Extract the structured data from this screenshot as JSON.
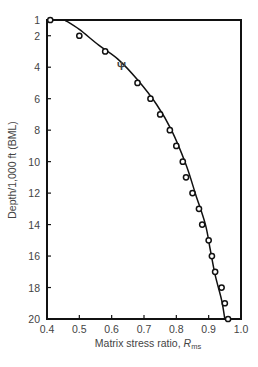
{
  "chart_data": {
    "type": "scatter",
    "title": "",
    "xlabel": "Matrix stress ratio, R",
    "xlabel_subscript": "ms",
    "ylabel": "Depth/1,000 ft (BML)",
    "xlim": [
      0.4,
      1.0
    ],
    "ylim": [
      20,
      1
    ],
    "y_inverted": true,
    "grid": false,
    "legend": null,
    "x_ticks": [
      "0.4",
      "0.5",
      "0.6",
      "0.7",
      "0.8",
      "0.9",
      "1.0"
    ],
    "y_ticks": [
      "1",
      "2",
      "4",
      "6",
      "8",
      "10",
      "12",
      "14",
      "16",
      "18",
      "20"
    ],
    "series": [
      {
        "name": "Measured data",
        "style": "open-circle",
        "points": [
          {
            "x": 0.41,
            "y": 1
          },
          {
            "x": 0.5,
            "y": 2
          },
          {
            "x": 0.58,
            "y": 3
          },
          {
            "x": 0.68,
            "y": 5
          },
          {
            "x": 0.72,
            "y": 6
          },
          {
            "x": 0.75,
            "y": 7
          },
          {
            "x": 0.78,
            "y": 8
          },
          {
            "x": 0.8,
            "y": 9
          },
          {
            "x": 0.82,
            "y": 10
          },
          {
            "x": 0.83,
            "y": 11
          },
          {
            "x": 0.85,
            "y": 12
          },
          {
            "x": 0.87,
            "y": 13
          },
          {
            "x": 0.88,
            "y": 14
          },
          {
            "x": 0.9,
            "y": 15
          },
          {
            "x": 0.91,
            "y": 16
          },
          {
            "x": 0.92,
            "y": 17
          },
          {
            "x": 0.94,
            "y": 18
          },
          {
            "x": 0.95,
            "y": 19
          },
          {
            "x": 0.96,
            "y": 20
          }
        ]
      },
      {
        "name": "Psi marker",
        "style": "psi-glyph",
        "points": [
          {
            "x": 0.63,
            "y": 3.9
          }
        ]
      },
      {
        "name": "Fitted curve",
        "style": "line",
        "points": [
          {
            "x": 0.455,
            "y": 1
          },
          {
            "x": 0.5,
            "y": 1.6
          },
          {
            "x": 0.56,
            "y": 2.6
          },
          {
            "x": 0.62,
            "y": 3.5
          },
          {
            "x": 0.68,
            "y": 4.8
          },
          {
            "x": 0.74,
            "y": 6.4
          },
          {
            "x": 0.785,
            "y": 8.0
          },
          {
            "x": 0.83,
            "y": 10.2
          },
          {
            "x": 0.86,
            "y": 12.1
          },
          {
            "x": 0.89,
            "y": 14.0
          },
          {
            "x": 0.905,
            "y": 15.6
          },
          {
            "x": 0.92,
            "y": 17.2
          },
          {
            "x": 0.94,
            "y": 18.8
          },
          {
            "x": 0.95,
            "y": 20
          }
        ]
      }
    ]
  },
  "colors": {
    "axis": "#111111",
    "text": "#444444",
    "marker": "#111111",
    "background": "#ffffff"
  }
}
